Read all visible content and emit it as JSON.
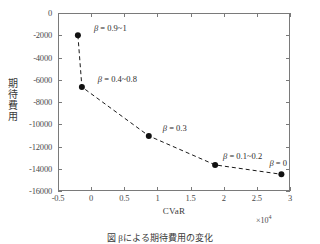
{
  "figure": {
    "caption": "図   βによる期待費用の変化"
  },
  "axes": {
    "x": {
      "title": "CVaR",
      "multiplier": "×10",
      "multiplier_exp": "4",
      "ticks": [
        "-0.5",
        "0",
        "0.5",
        "1",
        "1.5",
        "2",
        "2.5",
        "3"
      ],
      "range": [
        -0.5,
        3
      ]
    },
    "y": {
      "title": "期待費用",
      "ticks": [
        "0",
        "-2000",
        "-4000",
        "-6000",
        "-8000",
        "-10000",
        "-12000",
        "-14000",
        "-16000"
      ],
      "range": [
        -16000,
        0
      ]
    }
  },
  "chart_data": {
    "type": "line",
    "title": "",
    "xlabel": "CVaR",
    "ylabel": "期待費用",
    "xlim": [
      -0.5,
      3
    ],
    "ylim": [
      -16000,
      0
    ],
    "x_scale_factor": 10000,
    "grid": false,
    "legend": "none",
    "marker": "filled-circle",
    "linestyle": "dashed",
    "color": "#1a1a1a",
    "series": [
      {
        "name": "efficient frontier",
        "x": [
          -2000,
          -1400,
          8700,
          18700,
          28700
        ],
        "y": [
          -2000,
          -6650,
          -11050,
          -13650,
          -14500
        ]
      }
    ],
    "annotations": [
      {
        "label": "β = 0.9~1",
        "point_index": 0,
        "dx": 16,
        "dy": -12
      },
      {
        "label": "β = 0.4~0.8",
        "point_index": 1,
        "dx": 16,
        "dy": -13
      },
      {
        "label": "β = 0.3",
        "point_index": 2,
        "dx": 14,
        "dy": -13
      },
      {
        "label": "β = 0.1~0.2",
        "point_index": 3,
        "dx": 8,
        "dy": -14
      },
      {
        "label": "β = 0",
        "point_index": 4,
        "dx": -12,
        "dy": -16
      }
    ]
  }
}
